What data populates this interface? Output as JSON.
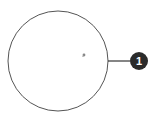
{
  "diagram": {
    "circle": {
      "cx": 58,
      "cy": 61,
      "r": 50,
      "stroke": "#555555"
    },
    "center_mark": {
      "x": 84,
      "y": 55,
      "color": "#888888"
    },
    "callout": {
      "line": {
        "x1": 108,
        "y1": 61,
        "x2": 130,
        "y2": 61,
        "stroke": "#333333"
      },
      "badge": {
        "cx": 139,
        "cy": 61,
        "r": 9,
        "fill": "#2b2b2b",
        "label": "1"
      }
    }
  }
}
